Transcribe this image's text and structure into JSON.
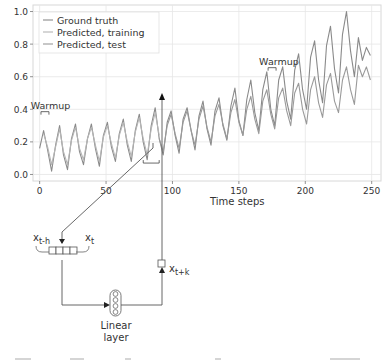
{
  "chart_data": {
    "type": "line",
    "title": "",
    "xlabel": "Time steps",
    "ylabel": "",
    "xlim": [
      -5,
      257
    ],
    "ylim": [
      -0.04,
      1.04
    ],
    "xticks": [
      0,
      50,
      100,
      150,
      200,
      250
    ],
    "xtick_labels": [
      "0",
      "50",
      "100",
      "150",
      "200",
      "250"
    ],
    "yticks": [
      0.0,
      0.2,
      0.4,
      0.6,
      0.8,
      1.0
    ],
    "ytick_labels": [
      "0.0",
      "0.2",
      "0.4",
      "0.6",
      "0.8",
      "1.0"
    ],
    "grid": true,
    "legend_position": "upper left",
    "legend": [
      "Ground truth",
      "Predicted, training",
      "Predicted, test"
    ],
    "annotations": [
      {
        "text": "Warmup",
        "x": 0,
        "y": 0.41,
        "bracket_x": [
          1,
          7
        ]
      },
      {
        "text": "Warmup",
        "x": 172,
        "y": 0.68,
        "bracket_x": [
          172,
          178
        ]
      }
    ],
    "series": [
      {
        "name": "Ground truth",
        "color": "#8a8a8a",
        "x": [
          0,
          3,
          6,
          9,
          12,
          15,
          18,
          21,
          24,
          27,
          30,
          33,
          36,
          39,
          42,
          45,
          48,
          51,
          54,
          57,
          60,
          63,
          66,
          69,
          72,
          75,
          78,
          81,
          84,
          87,
          90,
          93,
          96,
          99,
          102,
          105,
          108,
          111,
          114,
          117,
          120,
          123,
          126,
          129,
          132,
          135,
          138,
          141,
          144,
          147,
          150,
          153,
          156,
          159,
          162,
          165,
          168,
          171,
          174,
          177,
          180,
          183,
          186,
          189,
          192,
          195,
          198,
          201,
          204,
          207,
          210,
          213,
          216,
          219,
          222,
          225,
          228,
          231,
          234,
          237,
          240,
          243,
          246,
          249
        ],
        "values": [
          0.16,
          0.27,
          0.15,
          0.02,
          0.18,
          0.3,
          0.12,
          0.03,
          0.22,
          0.31,
          0.14,
          0.06,
          0.22,
          0.31,
          0.16,
          0.05,
          0.24,
          0.32,
          0.17,
          0.08,
          0.25,
          0.34,
          0.18,
          0.08,
          0.27,
          0.37,
          0.2,
          0.09,
          0.3,
          0.41,
          0.22,
          0.12,
          0.32,
          0.39,
          0.24,
          0.13,
          0.34,
          0.41,
          0.27,
          0.15,
          0.36,
          0.45,
          0.28,
          0.18,
          0.39,
          0.47,
          0.3,
          0.21,
          0.42,
          0.53,
          0.33,
          0.24,
          0.46,
          0.58,
          0.38,
          0.27,
          0.52,
          0.63,
          0.4,
          0.3,
          0.58,
          0.66,
          0.45,
          0.34,
          0.64,
          0.74,
          0.52,
          0.4,
          0.72,
          0.82,
          0.58,
          0.44,
          0.79,
          0.91,
          0.65,
          0.5,
          0.86,
          1.0,
          0.76,
          0.6,
          0.84,
          0.7,
          0.78,
          0.73
        ]
      },
      {
        "name": "Predicted, training",
        "color": "#b5b5b5",
        "x": [
          3,
          6,
          9,
          12,
          15,
          18,
          21,
          24,
          27,
          30,
          33,
          36,
          39,
          42,
          45,
          48,
          51,
          54,
          57,
          60,
          63,
          66,
          69,
          72,
          75,
          78,
          81,
          84,
          87,
          90
        ],
        "values": [
          0.25,
          0.17,
          0.06,
          0.17,
          0.28,
          0.14,
          0.06,
          0.21,
          0.29,
          0.16,
          0.09,
          0.22,
          0.29,
          0.18,
          0.08,
          0.23,
          0.3,
          0.19,
          0.1,
          0.24,
          0.32,
          0.2,
          0.11,
          0.26,
          0.35,
          0.22,
          0.12,
          0.28,
          0.38,
          0.24
        ]
      },
      {
        "name": "Predicted, test",
        "color": "#9a9a9a",
        "x": [
          90,
          93,
          96,
          99,
          102,
          105,
          108,
          111,
          114,
          117,
          120,
          123,
          126,
          129,
          132,
          135,
          138,
          141,
          144,
          147,
          150,
          153,
          156,
          159,
          162,
          165,
          168,
          171,
          174,
          177,
          180,
          183,
          186,
          189,
          192,
          195,
          198,
          201,
          204,
          207,
          210,
          213,
          216,
          219,
          222,
          225,
          228,
          231,
          234,
          237,
          240,
          243,
          246,
          249
        ],
        "values": [
          0.22,
          0.14,
          0.3,
          0.37,
          0.25,
          0.16,
          0.32,
          0.39,
          0.27,
          0.18,
          0.34,
          0.42,
          0.29,
          0.2,
          0.36,
          0.43,
          0.31,
          0.22,
          0.38,
          0.46,
          0.32,
          0.24,
          0.4,
          0.48,
          0.34,
          0.25,
          0.45,
          0.52,
          0.37,
          0.28,
          0.47,
          0.53,
          0.39,
          0.3,
          0.5,
          0.56,
          0.4,
          0.31,
          0.52,
          0.6,
          0.44,
          0.35,
          0.55,
          0.62,
          0.45,
          0.38,
          0.58,
          0.66,
          0.52,
          0.43,
          0.67,
          0.6,
          0.66,
          0.58
        ]
      }
    ]
  },
  "diagram": {
    "input_labels": {
      "left": "x",
      "left_sub": "t-h",
      "right": "x",
      "right_sub": "t"
    },
    "output_label": {
      "base": "x",
      "sub": "t+k"
    },
    "layer_label_line1": "Linear",
    "layer_label_line2": "layer",
    "input_cells": 4,
    "neuron_count": 4
  }
}
